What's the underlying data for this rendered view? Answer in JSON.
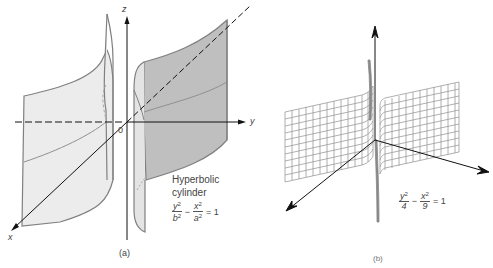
{
  "figure_a": {
    "caption": "(a)",
    "axis_labels": {
      "x": "x",
      "y": "y",
      "z": "z",
      "origin": "0"
    },
    "title_line1": "Hyperbolic",
    "title_line2": "cylinder",
    "equation": {
      "term1_num": "y",
      "term1_den": "b",
      "term2_num": "x",
      "term2_den": "a",
      "exponent": "2",
      "minus": "−",
      "equals": "= 1"
    },
    "colors": {
      "front_sheet": "#bfbfbf",
      "back_sheet": "#ececec",
      "edge": "#808080",
      "axis": "#111111"
    }
  },
  "figure_b": {
    "caption": "(b)",
    "equation": {
      "term1_num": "y",
      "term1_den": "4",
      "term2_num": "x",
      "term2_den": "9",
      "exponent": "2",
      "minus": "−",
      "equals": "= 1"
    },
    "colors": {
      "mesh": "#9a9a9a",
      "axis": "#111111"
    }
  }
}
